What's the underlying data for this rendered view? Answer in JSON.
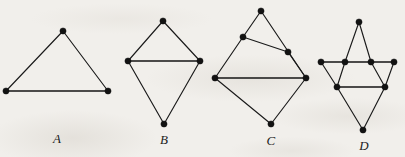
{
  "plate": {
    "background_color": "#f1efeb",
    "ink_color": "#121212",
    "width": 405,
    "height": 157,
    "caption_style": "italic-serif"
  },
  "figures": [
    {
      "id": "A",
      "label": "A",
      "label_pos": {
        "x": 57,
        "y": 139
      },
      "description": "triangle",
      "vertex_count": 3,
      "edge_count": 3,
      "vertices": [
        {
          "name": "apex",
          "x": 63,
          "y": 31
        },
        {
          "name": "bottom-left",
          "x": 6,
          "y": 91
        },
        {
          "name": "bottom-right",
          "x": 108,
          "y": 91
        }
      ],
      "edges": [
        {
          "from": 0,
          "to": 1,
          "weight": "thin"
        },
        {
          "from": 0,
          "to": 2,
          "weight": "thin"
        },
        {
          "from": 1,
          "to": 2,
          "weight": "thick"
        }
      ]
    },
    {
      "id": "B",
      "label": "B",
      "label_pos": {
        "x": 164,
        "y": 140
      },
      "description": "kite with horizontal chord",
      "vertex_count": 4,
      "edge_count": 5,
      "vertices": [
        {
          "name": "top",
          "x": 163,
          "y": 21
        },
        {
          "name": "left",
          "x": 128,
          "y": 61
        },
        {
          "name": "right",
          "x": 200,
          "y": 61
        },
        {
          "name": "bottom",
          "x": 164,
          "y": 124
        }
      ],
      "edges": [
        {
          "from": 0,
          "to": 1,
          "weight": "thin"
        },
        {
          "from": 0,
          "to": 2,
          "weight": "thin"
        },
        {
          "from": 1,
          "to": 2,
          "weight": "thick"
        },
        {
          "from": 1,
          "to": 3,
          "weight": "thin"
        },
        {
          "from": 2,
          "to": 3,
          "weight": "thin"
        }
      ]
    },
    {
      "id": "C",
      "label": "C",
      "label_pos": {
        "x": 271,
        "y": 141
      },
      "description": "two stacked quadrilaterals",
      "vertex_count": 6,
      "edge_count": 8,
      "vertices": [
        {
          "name": "top",
          "x": 261,
          "y": 11
        },
        {
          "name": "upper-left",
          "x": 243,
          "y": 37
        },
        {
          "name": "upper-right",
          "x": 288,
          "y": 52
        },
        {
          "name": "left",
          "x": 215,
          "y": 78
        },
        {
          "name": "right",
          "x": 306,
          "y": 78
        },
        {
          "name": "bottom",
          "x": 271,
          "y": 124
        }
      ],
      "edges": [
        {
          "from": 0,
          "to": 1,
          "weight": "thin"
        },
        {
          "from": 0,
          "to": 4,
          "weight": "thin"
        },
        {
          "from": 1,
          "to": 2,
          "weight": "thin"
        },
        {
          "from": 1,
          "to": 3,
          "weight": "thin"
        },
        {
          "from": 2,
          "to": 4,
          "weight": "thin"
        },
        {
          "from": 3,
          "to": 4,
          "weight": "thick"
        },
        {
          "from": 3,
          "to": 5,
          "weight": "thin"
        },
        {
          "from": 4,
          "to": 5,
          "weight": "thin"
        }
      ]
    },
    {
      "id": "D",
      "label": "D",
      "label_pos": {
        "x": 364,
        "y": 146
      },
      "description": "star-of-david style lattice",
      "vertex_count": 8,
      "edge_count": 12,
      "vertices": [
        {
          "name": "top",
          "x": 359,
          "y": 22
        },
        {
          "name": "row1-far-left",
          "x": 321,
          "y": 62
        },
        {
          "name": "row1-left",
          "x": 345,
          "y": 62
        },
        {
          "name": "row1-right",
          "x": 371,
          "y": 62
        },
        {
          "name": "row1-far-right",
          "x": 394,
          "y": 62
        },
        {
          "name": "row2-left",
          "x": 337,
          "y": 87
        },
        {
          "name": "row2-right",
          "x": 385,
          "y": 87
        },
        {
          "name": "bottom",
          "x": 363,
          "y": 130
        }
      ],
      "edges": [
        {
          "from": 0,
          "to": 2,
          "weight": "thin"
        },
        {
          "from": 0,
          "to": 3,
          "weight": "thin"
        },
        {
          "from": 1,
          "to": 2,
          "weight": "thick"
        },
        {
          "from": 2,
          "to": 3,
          "weight": "thick"
        },
        {
          "from": 3,
          "to": 4,
          "weight": "thick"
        },
        {
          "from": 1,
          "to": 5,
          "weight": "thin"
        },
        {
          "from": 2,
          "to": 5,
          "weight": "thin"
        },
        {
          "from": 3,
          "to": 6,
          "weight": "thin"
        },
        {
          "from": 4,
          "to": 6,
          "weight": "thin"
        },
        {
          "from": 5,
          "to": 6,
          "weight": "thick"
        },
        {
          "from": 5,
          "to": 7,
          "weight": "thin"
        },
        {
          "from": 6,
          "to": 7,
          "weight": "thin"
        }
      ]
    }
  ]
}
